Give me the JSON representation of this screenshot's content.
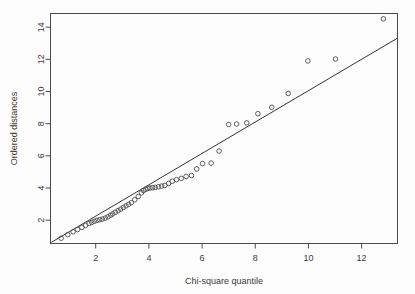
{
  "chart_data": {
    "type": "scatter",
    "title": "",
    "xlabel": "Chi-square quantile",
    "ylabel": "Ordered distances",
    "xlim": [
      0.3,
      13.35
    ],
    "ylim": [
      0.55,
      14.85
    ],
    "xticks": [
      2,
      4,
      6,
      8,
      10,
      12
    ],
    "yticks": [
      2,
      4,
      6,
      8,
      10,
      12,
      14
    ],
    "grid": false,
    "legend": null,
    "marker": "open-circle",
    "point_color": "#4d4d4d",
    "line_color": "#333333",
    "reference_line": {
      "type": "line",
      "x": [
        0.33,
        13.33
      ],
      "y": [
        0.62,
        13.3
      ]
    },
    "x": [
      0.7,
      0.95,
      1.15,
      1.32,
      1.48,
      1.62,
      1.75,
      1.85,
      1.95,
      2.05,
      2.15,
      2.25,
      2.35,
      2.45,
      2.55,
      2.62,
      2.72,
      2.82,
      2.92,
      3.02,
      3.12,
      3.22,
      3.32,
      3.45,
      3.58,
      3.7,
      3.78,
      3.86,
      3.94,
      4.02,
      4.12,
      4.22,
      4.34,
      4.46,
      4.58,
      4.72,
      4.86,
      5.02,
      5.2,
      5.38,
      5.58,
      5.78,
      6.0,
      6.32,
      6.62,
      6.98,
      7.28,
      7.66,
      8.08,
      8.6,
      9.22,
      9.96,
      11.0,
      12.8
    ],
    "y": [
      0.88,
      1.1,
      1.28,
      1.42,
      1.55,
      1.68,
      1.8,
      1.85,
      1.92,
      1.98,
      2.02,
      2.06,
      2.12,
      2.2,
      2.3,
      2.38,
      2.48,
      2.58,
      2.68,
      2.78,
      2.88,
      2.98,
      3.08,
      3.25,
      3.45,
      3.68,
      3.82,
      3.9,
      3.96,
      4.0,
      4.02,
      4.04,
      4.08,
      4.12,
      4.16,
      4.28,
      4.42,
      4.52,
      4.6,
      4.72,
      4.78,
      5.18,
      5.52,
      6.3,
      7.95,
      7.98,
      8.05,
      8.62,
      9.02,
      9.88,
      11.9,
      12.02,
      14.52,
      14.52
    ],
    "points": [
      {
        "x": 0.7,
        "y": 0.88
      },
      {
        "x": 0.95,
        "y": 1.1
      },
      {
        "x": 1.15,
        "y": 1.28
      },
      {
        "x": 1.32,
        "y": 1.42
      },
      {
        "x": 1.48,
        "y": 1.55
      },
      {
        "x": 1.62,
        "y": 1.68
      },
      {
        "x": 1.75,
        "y": 1.8
      },
      {
        "x": 1.85,
        "y": 1.86
      },
      {
        "x": 1.95,
        "y": 1.93
      },
      {
        "x": 2.05,
        "y": 1.99
      },
      {
        "x": 2.15,
        "y": 2.03
      },
      {
        "x": 2.25,
        "y": 2.07
      },
      {
        "x": 2.36,
        "y": 2.13
      },
      {
        "x": 2.46,
        "y": 2.21
      },
      {
        "x": 2.56,
        "y": 2.31
      },
      {
        "x": 2.64,
        "y": 2.39
      },
      {
        "x": 2.74,
        "y": 2.49
      },
      {
        "x": 2.84,
        "y": 2.59
      },
      {
        "x": 2.94,
        "y": 2.69
      },
      {
        "x": 3.04,
        "y": 2.79
      },
      {
        "x": 3.14,
        "y": 2.89
      },
      {
        "x": 3.24,
        "y": 2.99
      },
      {
        "x": 3.34,
        "y": 3.09
      },
      {
        "x": 3.47,
        "y": 3.27
      },
      {
        "x": 3.6,
        "y": 3.47
      },
      {
        "x": 3.72,
        "y": 3.7
      },
      {
        "x": 3.8,
        "y": 3.84
      },
      {
        "x": 3.88,
        "y": 3.92
      },
      {
        "x": 3.96,
        "y": 3.97
      },
      {
        "x": 4.04,
        "y": 4.0
      },
      {
        "x": 4.14,
        "y": 4.02
      },
      {
        "x": 4.24,
        "y": 4.04
      },
      {
        "x": 4.36,
        "y": 4.08
      },
      {
        "x": 4.48,
        "y": 4.12
      },
      {
        "x": 4.6,
        "y": 4.16
      },
      {
        "x": 4.74,
        "y": 4.28
      },
      {
        "x": 4.88,
        "y": 4.42
      },
      {
        "x": 5.04,
        "y": 4.52
      },
      {
        "x": 5.22,
        "y": 4.6
      },
      {
        "x": 5.4,
        "y": 4.72
      },
      {
        "x": 5.6,
        "y": 4.78
      },
      {
        "x": 5.8,
        "y": 5.18
      },
      {
        "x": 6.02,
        "y": 5.52
      },
      {
        "x": 6.34,
        "y": 5.55
      },
      {
        "x": 6.64,
        "y": 6.3
      },
      {
        "x": 7.0,
        "y": 7.95
      },
      {
        "x": 7.3,
        "y": 7.98
      },
      {
        "x": 7.68,
        "y": 8.05
      },
      {
        "x": 8.1,
        "y": 8.62
      },
      {
        "x": 8.62,
        "y": 9.02
      },
      {
        "x": 9.24,
        "y": 9.88
      },
      {
        "x": 9.98,
        "y": 11.9
      },
      {
        "x": 11.02,
        "y": 12.02
      },
      {
        "x": 12.82,
        "y": 14.52
      }
    ]
  }
}
